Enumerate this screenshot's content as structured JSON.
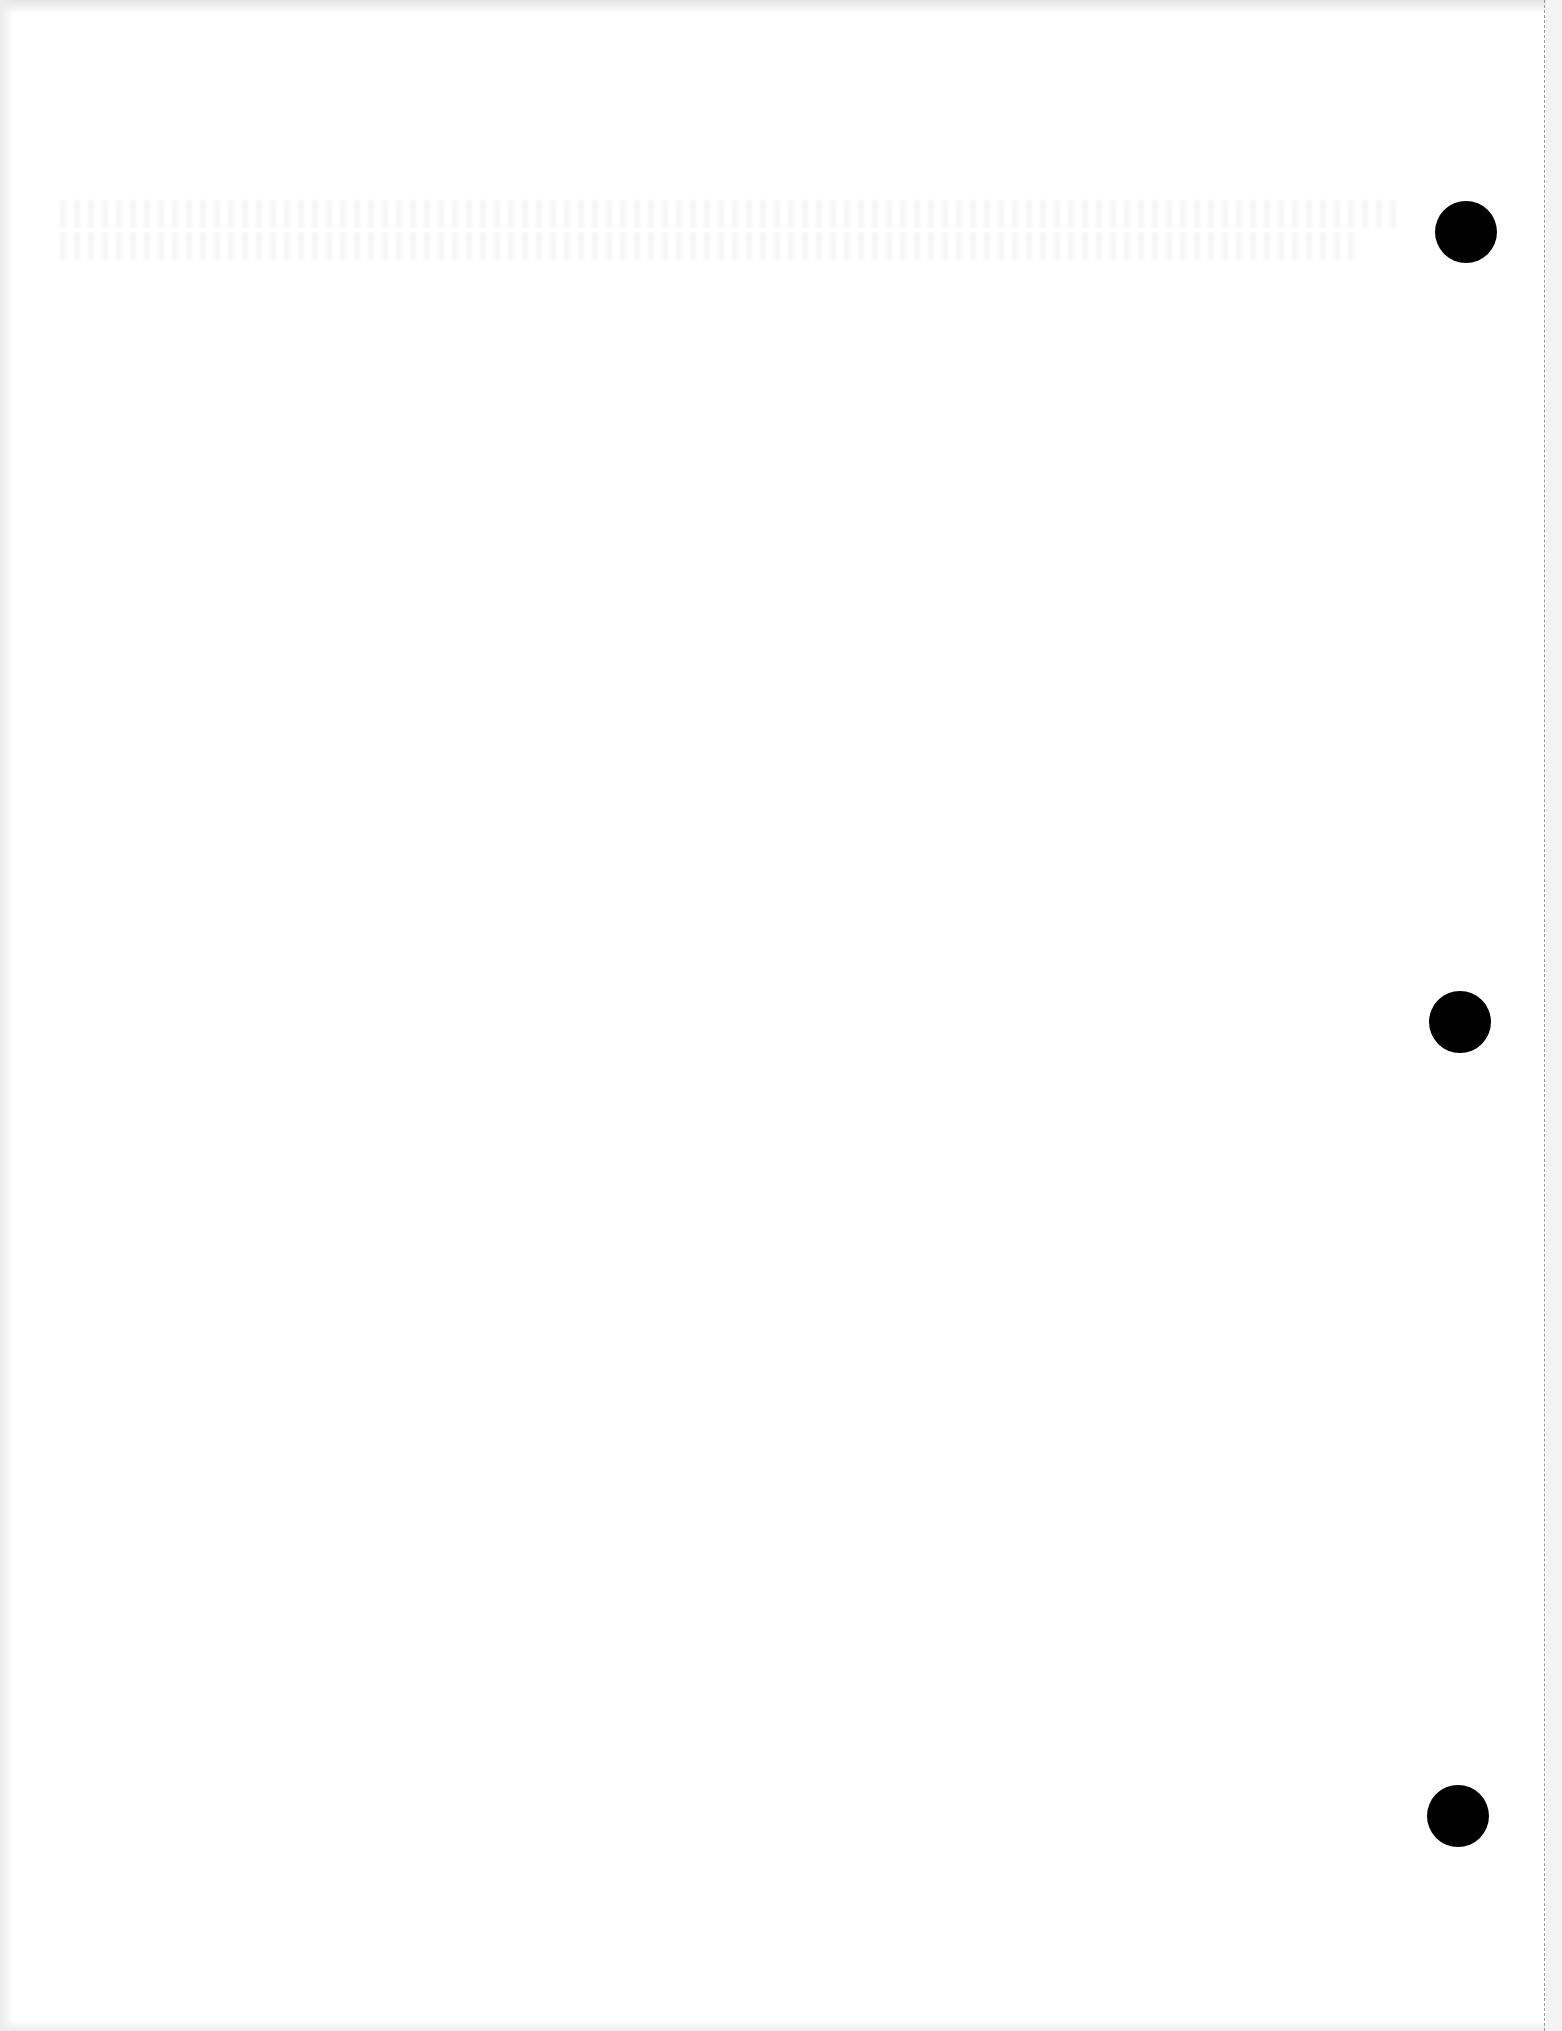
{
  "document": {
    "type": "blank three-hole-punched paper sheet",
    "visible_text": "",
    "holes": [
      {
        "cx": 1466,
        "cy": 232,
        "r": 31
      },
      {
        "cx": 1460,
        "cy": 1022,
        "r": 31
      },
      {
        "cx": 1458,
        "cy": 1816,
        "r": 31
      }
    ],
    "perforation_edge": "right",
    "colors": {
      "paper": "#ffffff",
      "hole": "#000000",
      "perforation": "#9a9a9a"
    }
  }
}
